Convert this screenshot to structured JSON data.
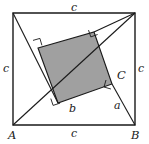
{
  "figure": {
    "type": "geometry-diagram",
    "colors": {
      "stroke": "#1a1a1a",
      "inner_square_fill": "#a0a0a0",
      "background": "#ffffff"
    },
    "outer_square": {
      "vertices": [
        {
          "name": "top-left",
          "x": 13,
          "y": 13
        },
        {
          "name": "top-right",
          "x": 135,
          "y": 13
        },
        {
          "name": "B",
          "x": 135,
          "y": 125
        },
        {
          "name": "A",
          "x": 13,
          "y": 125
        }
      ],
      "side_length_label": "c"
    },
    "inner_square": {
      "vertices": [
        {
          "name": "inner-top-left",
          "x": 38,
          "y": 48
        },
        {
          "name": "inner-top-right",
          "x": 94,
          "y": 32
        },
        {
          "name": "C",
          "x": 112,
          "y": 84
        },
        {
          "name": "inner-bottom-left",
          "x": 58,
          "y": 103
        }
      ],
      "fill": "#a0a0a0"
    },
    "labels": [
      {
        "id": "side-top",
        "text": "c",
        "x": 71,
        "y": 2,
        "style": "lower"
      },
      {
        "id": "side-left",
        "text": "c",
        "x": 3,
        "y": 63,
        "style": "lower"
      },
      {
        "id": "side-right",
        "text": "c",
        "x": 138,
        "y": 63,
        "style": "lower"
      },
      {
        "id": "side-bottom",
        "text": "c",
        "x": 71,
        "y": 128,
        "style": "lower"
      },
      {
        "id": "vertex-A",
        "text": "A",
        "x": 8,
        "y": 130,
        "style": "upper"
      },
      {
        "id": "vertex-B",
        "text": "B",
        "x": 131,
        "y": 130,
        "style": "upper"
      },
      {
        "id": "vertex-C",
        "text": "C",
        "x": 117,
        "y": 70,
        "style": "upper"
      },
      {
        "id": "leg-a",
        "text": "a",
        "x": 114,
        "y": 100,
        "style": "lower"
      },
      {
        "id": "leg-b",
        "text": "b",
        "x": 69,
        "y": 103,
        "style": "lower"
      }
    ],
    "right_angle_marks": [
      {
        "id": "mark-inner-top-left",
        "at_x": 38,
        "at_y": 48
      },
      {
        "id": "mark-inner-top-right",
        "at_x": 94,
        "at_y": 32
      },
      {
        "id": "mark-inner-bottom-left",
        "at_x": 58,
        "at_y": 103
      },
      {
        "id": "mark-vertex-C",
        "at_x": 112,
        "at_y": 84
      }
    ]
  }
}
